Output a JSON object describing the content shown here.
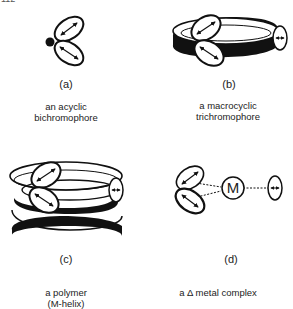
{
  "corner_fragment": "112",
  "panels": [
    {
      "id": "a",
      "label": "(a)",
      "caption_lines": [
        "an acyclic",
        "bichromophore"
      ]
    },
    {
      "id": "b",
      "label": "(b)",
      "caption_lines": [
        "a macrocyclic",
        "trichromophore"
      ]
    },
    {
      "id": "c",
      "label": "(c)",
      "caption_lines": [
        "a polymer",
        "(M-helix)"
      ]
    },
    {
      "id": "d",
      "label": "(d)",
      "caption_lines": [
        "a Δ metal complex"
      ],
      "metal_symbol": "M"
    }
  ],
  "colors": {
    "ink": "#111111",
    "background": "#ffffff"
  }
}
